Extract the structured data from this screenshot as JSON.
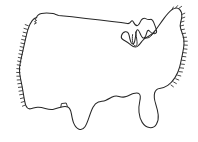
{
  "figure": {
    "kind": "outline-map",
    "style": "hand-drawn ink outline, unlabeled",
    "width": 198,
    "height": 142,
    "background_color": "#ffffff",
    "line_color": "#262626",
    "hatch_color": "#2b2b2b",
    "fill_color": "#ffffff",
    "labels_present": false,
    "caption": ""
  },
  "map": {
    "regions": [
      {
        "name": "northern-border",
        "description": "Straight 49th parallel border with Canada, slight downward sag"
      },
      {
        "name": "pacific-coast",
        "description": "West coast from Puget Sound down to southern California, hatched seaward"
      },
      {
        "name": "mexican-border",
        "description": "Stepped southwest border with Rio Grande dip"
      },
      {
        "name": "texas-gulf-coast",
        "description": "Texas southern tip and Gulf of Mexico shoreline"
      },
      {
        "name": "florida-peninsula",
        "description": "Florida hooking south then back north"
      },
      {
        "name": "atlantic-coast",
        "description": "East coast from Georgia up through the Carolinas, densely hatched"
      },
      {
        "name": "northeast-maine",
        "description": "New England and Maine peak at upper right, hatched"
      },
      {
        "name": "great-lakes",
        "description": "Great Lakes notch with Michigan lower peninsula"
      }
    ],
    "outline_path": "M 37 18 L 39 15 L 43 13 L 52 13 L 56 15 L 60 15 L 72 17 L 88 19 L 104 21 L 118 23 L 126 24 L 130 23 L 132 21 L 134 24 L 137 26 L 139 24 L 141 21 L 144 19 L 147 21 L 150 20 L 152 22 L 154 25 L 156 28 L 157 31 L 155 33 L 152 33 L 150 31 L 148 33 L 147 36 L 145 38 L 142 37 L 140 34 L 139 31 L 137 30 L 136 33 L 135 37 L 134 41 L 132 44 L 130 43 L 129 39 L 128 35 L 126 33 L 123 33 L 121 35 L 120 38 L 122 40 L 125 41 L 128 43 L 131 46 L 134 48 L 137 47 L 139 44 L 141 41 L 144 39 L 147 38 L 150 36 L 152 33 L 155 30 L 158 26 L 161 22 L 164 18 L 167 14 L 170 11 L 173 9 L 176 8 L 179 9 L 181 12 L 182 16 L 181 20 L 180 24 L 181 28 L 183 32 L 184 37 L 184 42 L 183 47 L 182 52 L 181 57 L 180 62 L 179 67 L 177 71 L 175 75 L 172 79 L 169 82 L 166 85 L 163 87 L 160 88 L 157 88 L 155 90 L 154 94 L 155 99 L 157 104 L 158 109 L 159 114 L 158 119 L 156 123 L 153 126 L 149 127 L 145 126 L 142 123 L 140 119 L 139 114 L 139 109 L 140 104 L 141 99 L 141 95 L 139 93 L 136 93 L 133 94 L 130 96 L 127 97 L 124 97 L 121 96 L 118 96 L 115 97 L 112 99 L 109 100 L 106 101 L 103 101 L 100 102 L 97 104 L 94 107 L 92 111 L 90 115 L 88 119 L 86 123 L 84 126 L 81 128 L 78 128 L 75 126 L 73 123 L 72 119 L 71 115 L 70 111 L 68 108 L 65 107 L 62 107 L 59 108 L 56 109 L 53 110 L 50 110 L 47 109 L 44 108 L 41 107 L 38 107 L 35 108 L 32 109 L 29 109 L 27 107 L 26 104 L 25 100 L 24 96 L 23 92 L 22 88 L 21 84 L 20 80 L 19 76 L 19 72 L 20 68 L 21 64 L 22 60 L 23 56 L 24 52 L 25 48 L 26 44 L 27 40 L 28 36 L 29 32 L 30 28 L 32 24 L 34 21 Z"
  }
}
